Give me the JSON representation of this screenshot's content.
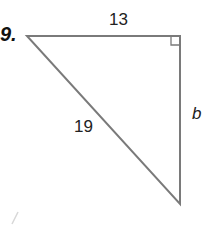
{
  "problem": {
    "number": "9.",
    "figure": "right-triangle",
    "sides": {
      "top_leg": "13",
      "hypotenuse": "19",
      "vertical_leg": "b"
    },
    "right_angle_at": "top-right",
    "stroke_color": "#7a7a7a"
  }
}
